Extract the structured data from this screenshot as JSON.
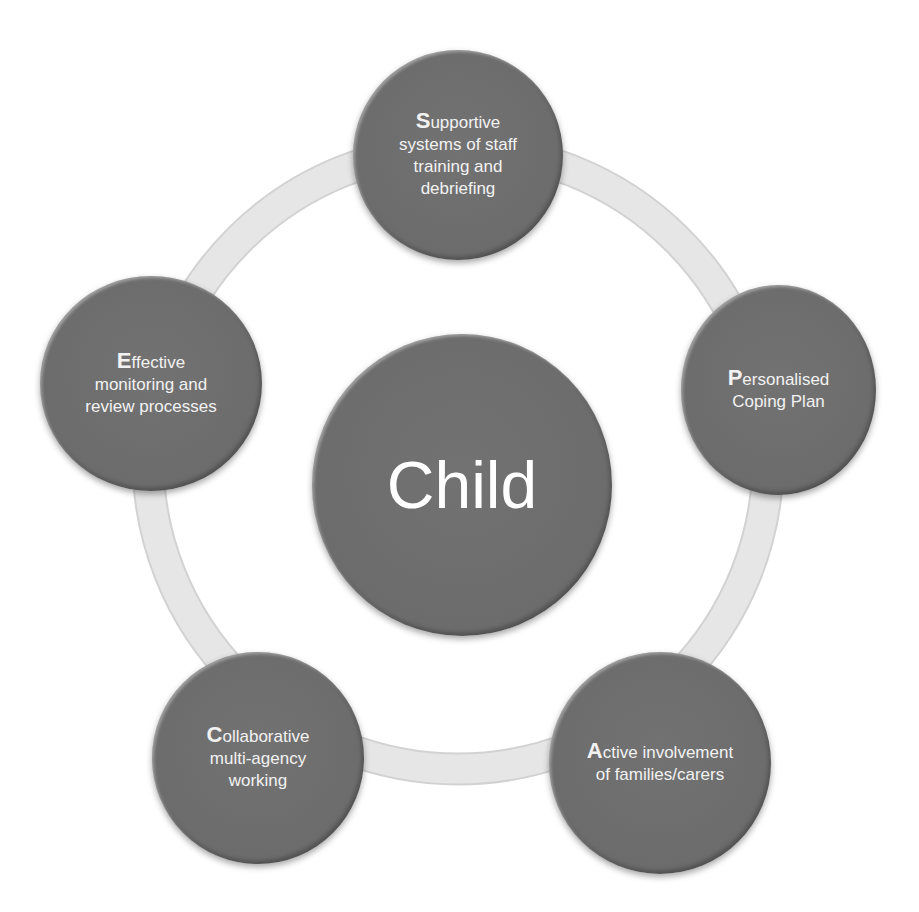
{
  "diagram": {
    "type": "cycle",
    "center": {
      "label": "Child"
    },
    "nodes": [
      {
        "initial": "S",
        "rest_line1": "upportive",
        "lines": [
          "systems of staff",
          "training and",
          "debriefing"
        ]
      },
      {
        "initial": "P",
        "rest_line1": "ersonalised",
        "lines": [
          "Coping Plan"
        ]
      },
      {
        "initial": "A",
        "rest_line1": "ctive involvement",
        "lines": [
          "of families/carers"
        ]
      },
      {
        "initial": "C",
        "rest_line1": "ollaborative",
        "lines": [
          "multi-agency",
          "working"
        ]
      },
      {
        "initial": "E",
        "rest_line1": "ffective",
        "lines": [
          "monitoring and",
          "review processes"
        ]
      }
    ],
    "colors": {
      "node_fill": "#6e6e6e",
      "ring": "#e4e4e4",
      "text": "#f2f2f2",
      "background": "#ffffff"
    }
  }
}
